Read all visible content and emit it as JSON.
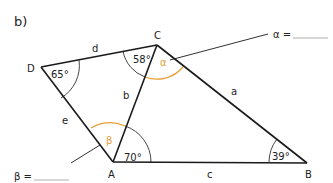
{
  "part_label": "b)",
  "vertices": {
    "A": "A",
    "B": "B",
    "C": "C",
    "D": "D"
  },
  "sides": {
    "a": "a",
    "b": "b",
    "c": "c",
    "d": "d",
    "e": "e"
  },
  "angles": {
    "D": "65°",
    "C_known": "58°",
    "A_known": "70°",
    "B": "39°",
    "alpha": "α",
    "beta": "β"
  },
  "answers": {
    "alpha_prompt": "α =",
    "beta_prompt": "β ="
  },
  "colors": {
    "line": "#1a1a1a",
    "arc": "#333333",
    "highlight": "#e8a03a",
    "answer_line": "#999999"
  }
}
